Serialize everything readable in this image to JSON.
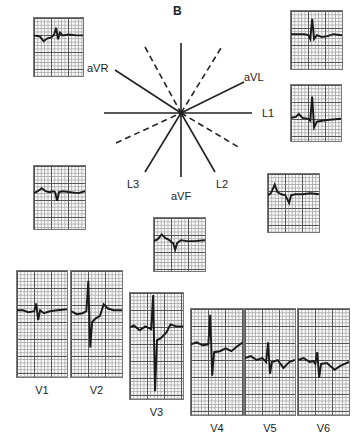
{
  "figure": {
    "panel_label": "B",
    "hexaxial_labels": {
      "aVR": "aVR",
      "aVL": "aVL",
      "L1": "L1",
      "L2": "L2",
      "L3": "L3",
      "aVF": "aVF"
    },
    "limb_leads": [
      {
        "lead": "aVR",
        "position": "top-left"
      },
      {
        "lead": "aVL",
        "position": "top-right"
      },
      {
        "lead": "L1",
        "position": "right"
      },
      {
        "lead": "L3",
        "position": "left-middle"
      },
      {
        "lead": "L2",
        "position": "right-middle"
      },
      {
        "lead": "aVF",
        "position": "bottom-center"
      }
    ],
    "precordial_leads": [
      {
        "label": "V1"
      },
      {
        "label": "V2"
      },
      {
        "label": "V3"
      },
      {
        "label": "V4"
      },
      {
        "label": "V5"
      },
      {
        "label": "V6"
      }
    ],
    "colors": {
      "trace": "#1a1a1a",
      "grid_major": "#555555",
      "grid_minor": "#aaaaaa",
      "background": "#ffffff"
    }
  }
}
